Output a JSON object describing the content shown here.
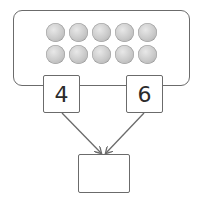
{
  "diagram": {
    "type": "part-whole number bond",
    "counters": {
      "rows": 2,
      "columns": 5,
      "total": 10,
      "color": "#c9c9c9"
    },
    "parts": [
      {
        "label": "4"
      },
      {
        "label": "6"
      }
    ],
    "whole": {
      "label": ""
    },
    "colors": {
      "stroke": "#6b6b6b",
      "text": "#2b2b2b",
      "background": "#ffffff"
    }
  }
}
